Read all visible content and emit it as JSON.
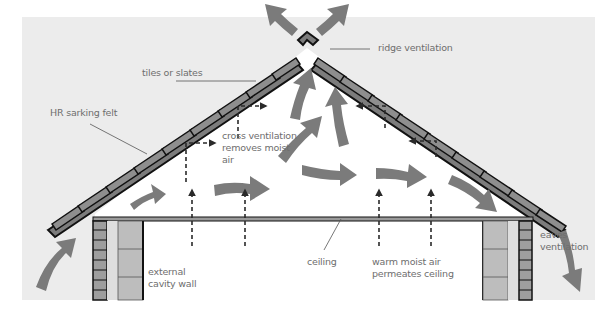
{
  "diagram": {
    "colors": {
      "background_panel": "#ececec",
      "attic_interior": "#ffffff",
      "airflow_arrow": "#7b7b7b",
      "roof_tile": "#8a8a8a",
      "outline": "#1a1a1a",
      "label_text": "#6e6e6e",
      "wall_block": "#b8b8b8"
    },
    "labels": {
      "tiles": "tiles or slates",
      "sarking": "HR sarking felt",
      "ridge": "ridge ventilation",
      "cross_line1": "cross ventilation",
      "cross_line2": "removes moist",
      "cross_line3": "air",
      "ceiling": "ceiling",
      "warm_line1": "warm moist air",
      "warm_line2": "permeates ceiling",
      "wall_line1": "external",
      "wall_line2": "cavity wall",
      "eaves_line1": "eaves",
      "eaves_line2": "ventilation"
    },
    "elements": [
      "pitched roof with tiles or slates",
      "ridge vent cap",
      "ceiling joist line",
      "left external cavity wall",
      "right external cavity wall",
      "airflow arrows (eaves in, ridge out)",
      "dashed moisture arrows through ceiling",
      "dashed cross-ventilation arrows under roof"
    ]
  }
}
